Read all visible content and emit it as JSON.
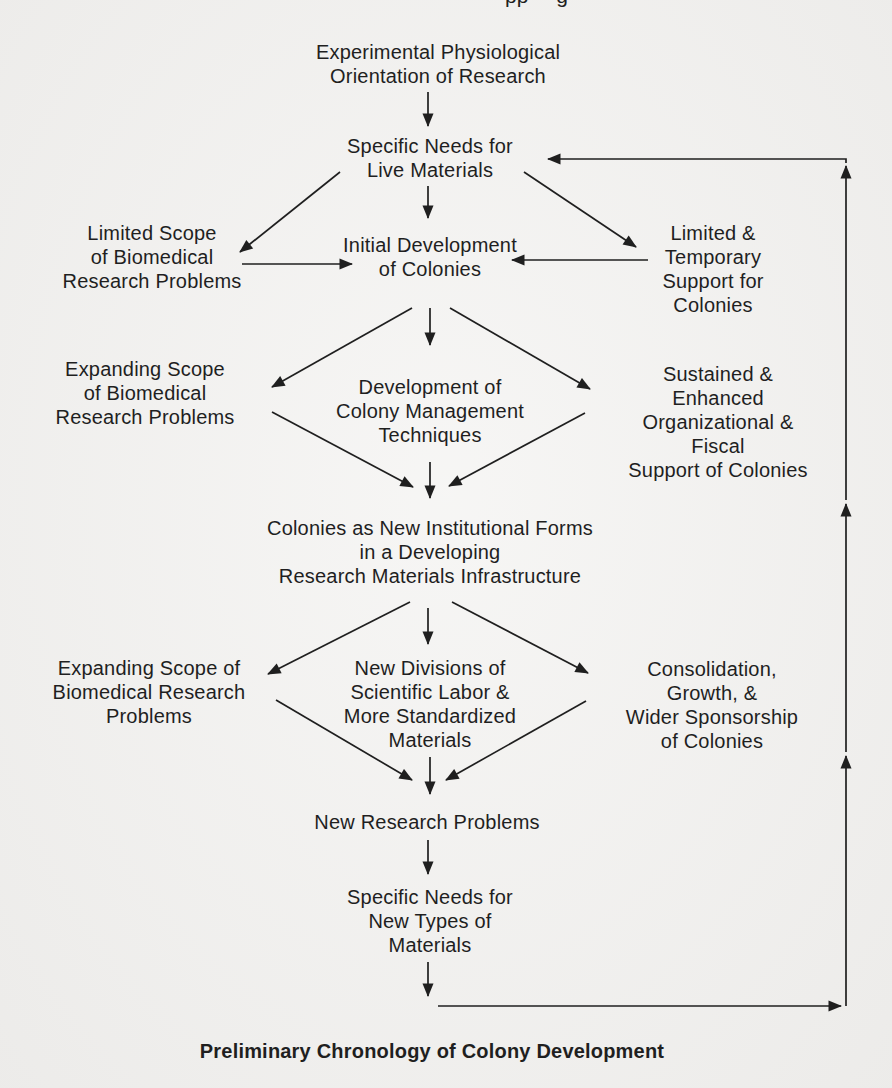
{
  "colors": {
    "paper": "#f2f1ef",
    "ink": "#1f1f1f"
  },
  "page": {
    "header_fragment": "pp g",
    "caption": "Preliminary Chronology of Colony Development"
  },
  "diagram": {
    "nodes": {
      "experimental_orientation": "Experimental Physiological\nOrientation of Research",
      "specific_needs_live": "Specific Needs for\nLive Materials",
      "limited_scope": "Limited Scope\nof Biomedical\nResearch Problems",
      "initial_development": "Initial Development\nof Colonies",
      "limited_temporary_support": "Limited &\nTemporary\nSupport for\nColonies",
      "expanding_scope_1": "Expanding Scope\nof Biomedical\nResearch Problems",
      "colony_management": "Development of\nColony Management\nTechniques",
      "sustained_support": "Sustained &\nEnhanced\nOrganizational &\nFiscal\nSupport of Colonies",
      "colonies_institutional": "Colonies as New Institutional Forms\nin a Developing\nResearch Materials Infrastructure",
      "expanding_scope_2": "Expanding Scope of\nBiomedical Research\nProblems",
      "new_divisions": "New Divisions of\nScientific Labor &\nMore Standardized\nMaterials",
      "consolidation": "Consolidation,\nGrowth, &\nWider Sponsorship\nof Colonies",
      "new_research_problems": "New Research Problems",
      "specific_needs_new": "Specific Needs for\nNew Types of\nMaterials"
    }
  }
}
